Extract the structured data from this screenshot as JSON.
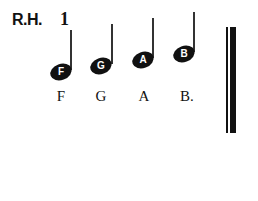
{
  "header": {
    "hand": "R.H.",
    "finger": "1"
  },
  "notes": [
    {
      "letter": "F",
      "label": "F"
    },
    {
      "letter": "G",
      "label": "G"
    },
    {
      "letter": "A",
      "label": "A"
    },
    {
      "letter": "B",
      "label": "B."
    }
  ]
}
